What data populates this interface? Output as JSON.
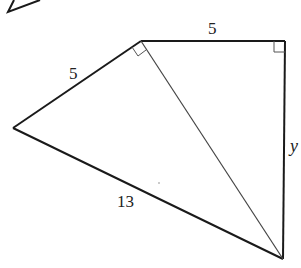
{
  "diagram": {
    "type": "geometry",
    "colors": {
      "stroke": "#1a1a1a",
      "thin_stroke": "#444444",
      "background": "#ffffff"
    },
    "vertices": {
      "A": {
        "x": 141,
        "y": 41
      },
      "B": {
        "x": 285,
        "y": 41
      },
      "C": {
        "x": 13,
        "y": 128
      },
      "D": {
        "x": 283,
        "y": 259
      }
    },
    "segments": [
      {
        "from": "A",
        "to": "B",
        "label": "5"
      },
      {
        "from": "B",
        "to": "D",
        "label": "y"
      },
      {
        "from": "C",
        "to": "A",
        "label": "5"
      },
      {
        "from": "C",
        "to": "D",
        "label": "13"
      },
      {
        "from": "A",
        "to": "D",
        "label": ""
      }
    ],
    "right_angles": [
      "A (between CA and AD)",
      "B (between AB and BD)"
    ],
    "labels": {
      "top": "5",
      "left": "5",
      "bottom": "13",
      "right": "y"
    }
  }
}
